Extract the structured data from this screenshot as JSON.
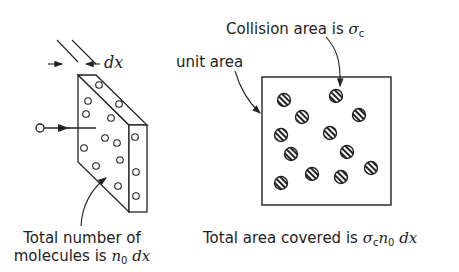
{
  "left_panel": {
    "thickness_label": "dx",
    "caption_line1": "Total number of",
    "caption_line2_prefix": "molecules is ",
    "caption_math_n": "n",
    "caption_math_sub": "0",
    "caption_math_dx": " dx",
    "incoming_molecule": "molecule-with-arrow"
  },
  "right_panel": {
    "collision_label_prefix": "Collision area is ",
    "collision_sigma": "σ",
    "collision_sub": "c",
    "unit_area_label": "unit area",
    "caption_prefix": "Total area covered is ",
    "caption_sigma": "σ",
    "caption_sigma_sub": "c",
    "caption_n": "n",
    "caption_n_sub": "0",
    "caption_dx": " dx"
  },
  "colors": {
    "line": "#222222",
    "background": "#ffffff"
  }
}
